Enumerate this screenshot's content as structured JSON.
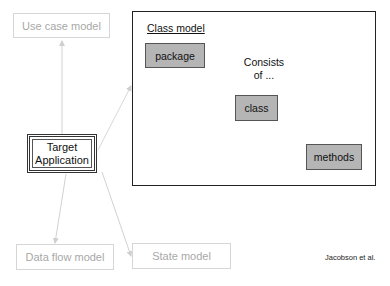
{
  "diagram": {
    "center": {
      "line1": "Target",
      "line2": "Application"
    },
    "satellites": {
      "use_case": "Use case model",
      "data_flow": "Data flow model",
      "state": "State model"
    },
    "class_model": {
      "title": "Class model",
      "nodes": [
        "package",
        "class",
        "methods"
      ],
      "relation_label_line1": "Consists",
      "relation_label_line2": "of ..."
    },
    "credit": "Jacobson et al.",
    "colors": {
      "faded_border": "#d6d6d6",
      "faded_text": "#a8a8a8",
      "node_fill": "#b5b5b5",
      "frame": "#222222"
    }
  }
}
